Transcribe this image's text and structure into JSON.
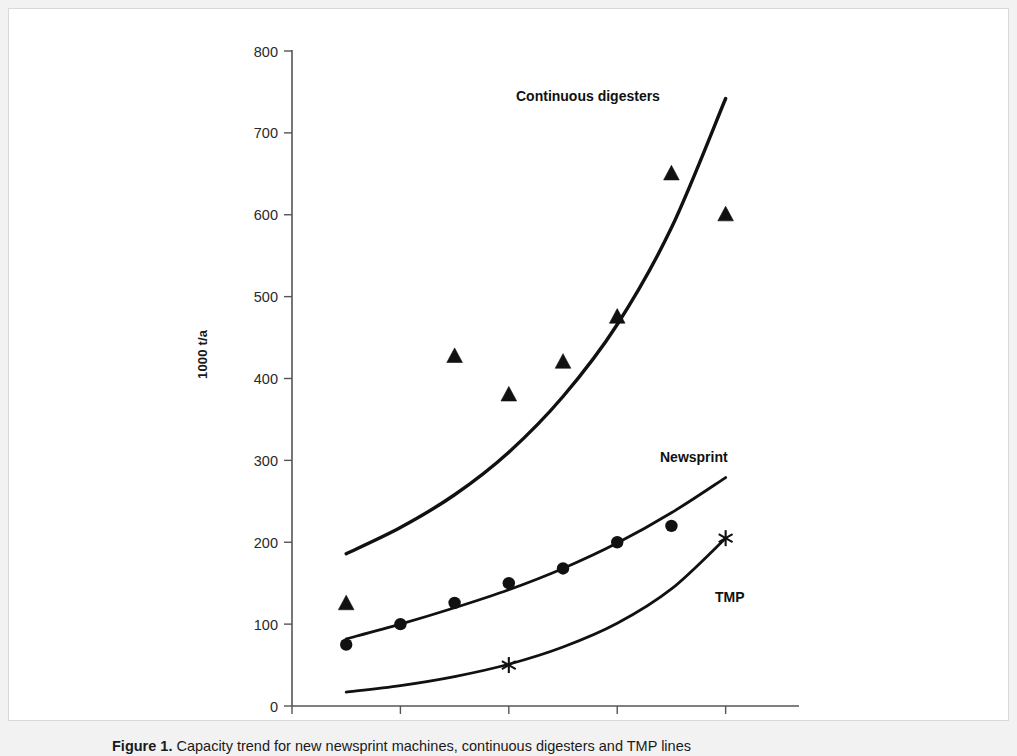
{
  "figure": {
    "caption_label": "Figure 1.",
    "caption_text": "Capacity trend for new newsprint machines, continuous digesters and TMP lines"
  },
  "chart_data": {
    "type": "scatter",
    "title": "",
    "subtitle": "",
    "xlabel": "",
    "ylabel": "1000 t/a",
    "xlim": [
      1955,
      1999
    ],
    "ylim": [
      0,
      800
    ],
    "grid": false,
    "legend_position": "inline-annotations",
    "x_ticks": [
      "1955",
      "1965",
      "1975",
      "1985",
      "1995"
    ],
    "x_tick_values": [
      1955,
      1965,
      1975,
      1985,
      1995
    ],
    "y_ticks": [
      "0",
      "100",
      "200",
      "300",
      "400",
      "500",
      "600",
      "700",
      "800"
    ],
    "y_tick_values": [
      0,
      100,
      200,
      300,
      400,
      500,
      600,
      700,
      800
    ],
    "series": [
      {
        "name": "Continuous digesters",
        "marker": "filled-triangle",
        "color": "#111111",
        "points": [
          {
            "x": 1960,
            "y": 125
          },
          {
            "x": 1970,
            "y": 427
          },
          {
            "x": 1975,
            "y": 380
          },
          {
            "x": 1980,
            "y": 420
          },
          {
            "x": 1985,
            "y": 475
          },
          {
            "x": 1990,
            "y": 650
          },
          {
            "x": 1995,
            "y": 600
          }
        ],
        "trend": [
          {
            "x": 1960,
            "y": 186
          },
          {
            "x": 1965,
            "y": 218
          },
          {
            "x": 1970,
            "y": 258
          },
          {
            "x": 1975,
            "y": 310
          },
          {
            "x": 1980,
            "y": 378
          },
          {
            "x": 1985,
            "y": 466
          },
          {
            "x": 1990,
            "y": 584
          },
          {
            "x": 1995,
            "y": 742
          }
        ]
      },
      {
        "name": "Newsprint",
        "marker": "filled-circle",
        "color": "#111111",
        "points": [
          {
            "x": 1960,
            "y": 75
          },
          {
            "x": 1965,
            "y": 100
          },
          {
            "x": 1970,
            "y": 126
          },
          {
            "x": 1975,
            "y": 150
          },
          {
            "x": 1980,
            "y": 168
          },
          {
            "x": 1985,
            "y": 200
          },
          {
            "x": 1990,
            "y": 220
          }
        ],
        "trend": [
          {
            "x": 1960,
            "y": 82
          },
          {
            "x": 1965,
            "y": 100
          },
          {
            "x": 1970,
            "y": 120
          },
          {
            "x": 1975,
            "y": 142
          },
          {
            "x": 1980,
            "y": 168
          },
          {
            "x": 1985,
            "y": 199
          },
          {
            "x": 1990,
            "y": 236
          },
          {
            "x": 1995,
            "y": 279
          }
        ]
      },
      {
        "name": "TMP",
        "marker": "star",
        "color": "#111111",
        "points": [
          {
            "x": 1975,
            "y": 50
          },
          {
            "x": 1995,
            "y": 205
          }
        ],
        "trend": [
          {
            "x": 1960,
            "y": 17
          },
          {
            "x": 1965,
            "y": 25
          },
          {
            "x": 1970,
            "y": 36
          },
          {
            "x": 1975,
            "y": 51
          },
          {
            "x": 1980,
            "y": 72
          },
          {
            "x": 1985,
            "y": 101
          },
          {
            "x": 1990,
            "y": 143
          },
          {
            "x": 1995,
            "y": 205
          }
        ]
      }
    ],
    "annotations": [
      {
        "id": "digesters",
        "text": "Continuous digesters"
      },
      {
        "id": "newsprint",
        "text": "Newsprint"
      },
      {
        "id": "tmp",
        "text": "TMP"
      }
    ]
  }
}
